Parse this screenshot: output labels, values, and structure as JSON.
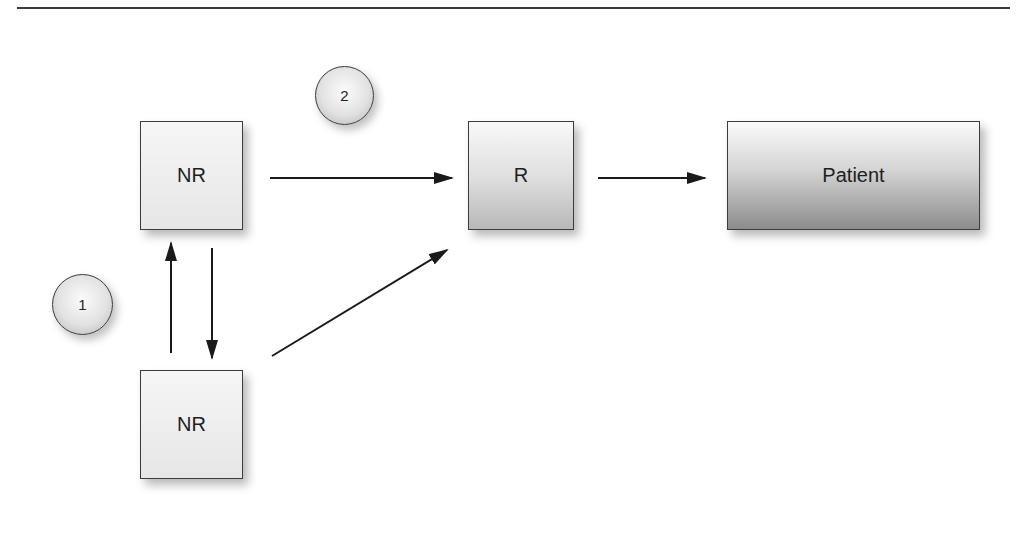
{
  "diagram": {
    "nodes": {
      "nr_top": {
        "label": "NR"
      },
      "nr_bottom": {
        "label": "NR"
      },
      "r": {
        "label": "R"
      },
      "patient": {
        "label": "Patient"
      }
    },
    "markers": {
      "one": {
        "label": "1"
      },
      "two": {
        "label": "2"
      }
    },
    "edges": [
      {
        "from": "NR (top)",
        "to": "R"
      },
      {
        "from": "NR (bottom)",
        "to": "R"
      },
      {
        "from": "NR (bottom)",
        "to": "NR (top)"
      },
      {
        "from": "NR (top)",
        "to": "NR (bottom)"
      },
      {
        "from": "R",
        "to": "Patient"
      }
    ],
    "colors": {
      "line": "#1a1a1a",
      "border": "#3c3c3c"
    }
  }
}
